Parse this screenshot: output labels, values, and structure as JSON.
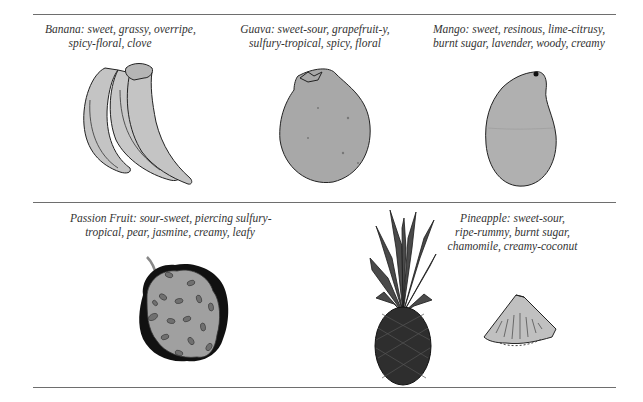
{
  "fruits": [
    {
      "name": "Banana",
      "lines": [
        "Banana: sweet, grassy, overripe,",
        "spicy-floral, clove"
      ]
    },
    {
      "name": "Guava",
      "lines": [
        "Guava: sweet-sour, grapefruit-y,",
        "sulfury-tropical, spicy, floral"
      ]
    },
    {
      "name": "Mango",
      "lines": [
        "Mango: sweet, resinous, lime-citrusy,",
        "burnt sugar, lavender, woody, creamy"
      ]
    },
    {
      "name": "Passion Fruit",
      "lines": [
        "Passion Fruit: sour-sweet, piercing sulfury-",
        "tropical, pear, jasmine, creamy, leafy"
      ]
    },
    {
      "name": "Pineapple",
      "lines": [
        "Pineapple: sweet-sour,",
        "ripe-rummy, burnt sugar,",
        "chamomile, creamy-coconut"
      ]
    }
  ],
  "colors": {
    "rule": "#6e6e6e",
    "fill_light": "#c4c4c4",
    "fill_mid": "#a8a8a8",
    "fill_dark": "#3c3c3c",
    "outline": "#222222"
  }
}
